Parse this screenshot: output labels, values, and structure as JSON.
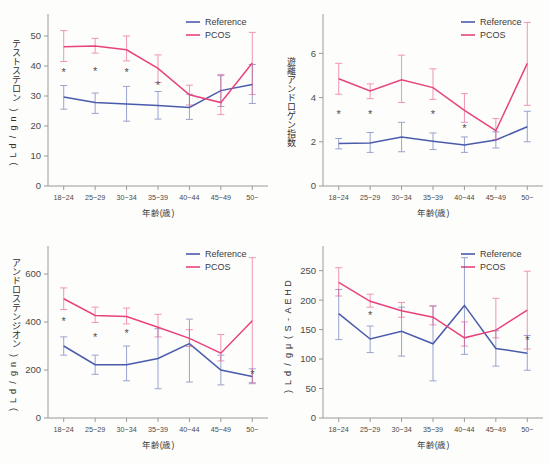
{
  "figure": {
    "series_names": [
      "Reference",
      "PCOS"
    ],
    "colors": {
      "reference": "#4a5bab",
      "pcos": "#e8427c",
      "axis": "#9a9a96",
      "star": "#4d4d52"
    },
    "xlabel": "年齢(歳)",
    "categories": [
      "18~24",
      "25~29",
      "30~34",
      "35~39",
      "40~44",
      "45~49",
      "50~"
    ]
  },
  "chart_data": [
    {
      "type": "line",
      "panel": "top-left",
      "title": "",
      "ylabel": "テストステロン(ng/dL)",
      "xlabel": "年齢(歳)",
      "categories": [
        "18~24",
        "25~29",
        "30~34",
        "35~39",
        "40~44",
        "45~49",
        "50~"
      ],
      "ylim": [
        0,
        56
      ],
      "yticks": [
        0,
        10,
        20,
        30,
        40,
        50
      ],
      "grid": false,
      "legend_position": "top-right",
      "series": [
        {
          "name": "Reference",
          "color": "#4a5bab",
          "values": [
            29.7,
            27.8,
            27.3,
            26.8,
            26.2,
            31.8,
            33.8
          ],
          "err_low": [
            25.6,
            24.2,
            21.6,
            22.3,
            22.2,
            26.5,
            27.5
          ],
          "err_high": [
            33.5,
            31.0,
            33.2,
            31.5,
            30.6,
            36.8,
            40.5
          ]
        },
        {
          "name": "PCOS",
          "color": "#e8427c",
          "values": [
            46.4,
            46.7,
            45.4,
            39.2,
            30.4,
            27.8,
            41.0
          ],
          "err_low": [
            41.5,
            44.3,
            41.7,
            34.5,
            27.0,
            23.8,
            30.5
          ],
          "err_high": [
            51.8,
            49.2,
            50.0,
            43.7,
            33.6,
            37.2,
            51.2
          ]
        }
      ],
      "significance_markers": [
        {
          "category": "18~24",
          "symbol": "*"
        },
        {
          "category": "25~29",
          "symbol": "*"
        },
        {
          "category": "30~34",
          "symbol": "*"
        },
        {
          "category": "35~39",
          "symbol": "*"
        }
      ]
    },
    {
      "type": "line",
      "panel": "top-right",
      "title": "",
      "ylabel": "遊離アンドロゲン指数",
      "xlabel": "年齢(歳)",
      "categories": [
        "18~24",
        "25~29",
        "30~34",
        "35~39",
        "40~44",
        "45~49",
        "50~"
      ],
      "ylim": [
        0,
        7.6
      ],
      "yticks": [
        0,
        2,
        4,
        6
      ],
      "grid": false,
      "legend_position": "top-right",
      "series": [
        {
          "name": "Reference",
          "color": "#4a5bab",
          "values": [
            1.92,
            1.95,
            2.22,
            2.02,
            1.85,
            2.08,
            2.68
          ],
          "err_low": [
            1.68,
            1.52,
            1.55,
            1.65,
            1.52,
            1.72,
            2.0
          ],
          "err_high": [
            2.15,
            2.42,
            2.88,
            2.4,
            2.22,
            2.45,
            3.38
          ]
        },
        {
          "name": "PCOS",
          "color": "#e8427c",
          "values": [
            4.85,
            4.3,
            4.8,
            4.45,
            3.42,
            2.5,
            5.55
          ],
          "err_low": [
            4.15,
            3.95,
            3.78,
            3.92,
            2.88,
            2.1,
            3.65
          ],
          "err_high": [
            5.55,
            4.62,
            5.92,
            5.3,
            4.18,
            3.05,
            7.4
          ]
        }
      ],
      "significance_markers": [
        {
          "category": "18~24",
          "symbol": "*"
        },
        {
          "category": "25~29",
          "symbol": "*"
        },
        {
          "category": "35~39",
          "symbol": "*"
        },
        {
          "category": "40~44",
          "symbol": "*"
        }
      ]
    },
    {
      "type": "line",
      "panel": "bottom-left",
      "title": "",
      "ylabel": "アンドロステンジオン(ng/dL)",
      "xlabel": "年齢(歳)",
      "categories": [
        "18~24",
        "25~29",
        "30~34",
        "35~39",
        "40~44",
        "45~49",
        "50~"
      ],
      "ylim": [
        0,
        700
      ],
      "yticks": [
        0,
        200,
        400,
        600
      ],
      "grid": false,
      "legend_position": "top-right",
      "series": [
        {
          "name": "Reference",
          "color": "#4a5bab",
          "values": [
            300,
            222,
            222,
            248,
            310,
            200,
            173
          ],
          "err_low": [
            262,
            182,
            155,
            122,
            150,
            138,
            143
          ],
          "err_high": [
            338,
            262,
            300,
            372,
            412,
            262,
            205
          ]
        },
        {
          "name": "PCOS",
          "color": "#e8427c",
          "values": [
            497,
            427,
            423,
            378,
            332,
            270,
            405
          ],
          "err_low": [
            452,
            398,
            392,
            338,
            298,
            238,
            148
          ],
          "err_high": [
            542,
            462,
            458,
            432,
            368,
            348,
            668
          ]
        }
      ],
      "significance_markers": [
        {
          "category": "18~24",
          "symbol": "*"
        },
        {
          "category": "25~29",
          "symbol": "*"
        },
        {
          "category": "30~34",
          "symbol": "*"
        },
        {
          "category": "50~",
          "symbol": "*"
        }
      ]
    },
    {
      "type": "line",
      "panel": "bottom-right",
      "title": "",
      "ylabel": "DHEA-S(μg/dL)",
      "xlabel": "年齢(歳)",
      "categories": [
        "18~24",
        "25~29",
        "30~34",
        "35~39",
        "40~44",
        "45~49",
        "50~"
      ],
      "ylim": [
        0,
        285
      ],
      "yticks": [
        0,
        50,
        100,
        150,
        200,
        250
      ],
      "grid": false,
      "legend_position": "top-right",
      "series": [
        {
          "name": "Reference",
          "color": "#4a5bab",
          "values": [
            177,
            134,
            147,
            126,
            191,
            118,
            110
          ],
          "err_low": [
            133,
            111,
            105,
            63,
            108,
            88,
            81
          ],
          "err_high": [
            218,
            156,
            188,
            190,
            272,
            148,
            140
          ]
        },
        {
          "name": "PCOS",
          "color": "#e8427c",
          "values": [
            230,
            198,
            182,
            171,
            136,
            149,
            183
          ],
          "err_low": [
            207,
            188,
            171,
            158,
            122,
            136,
            117
          ],
          "err_high": [
            255,
            210,
            196,
            190,
            163,
            203,
            249
          ]
        }
      ],
      "significance_markers": [
        {
          "category": "25~29",
          "symbol": "*"
        },
        {
          "category": "50~",
          "symbol": "*"
        }
      ]
    }
  ]
}
